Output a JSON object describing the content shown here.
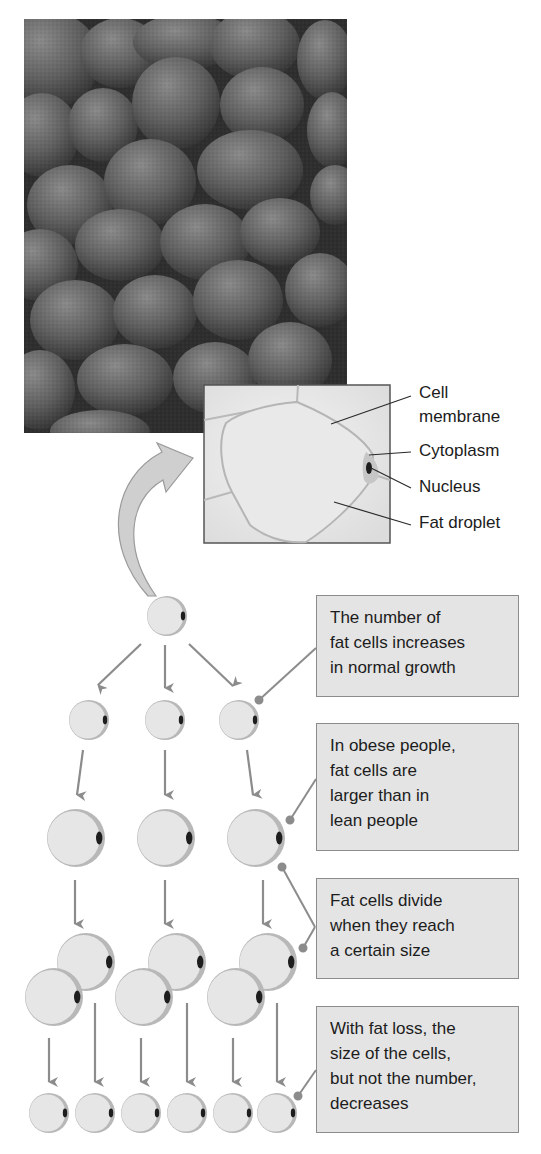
{
  "inset_labels": {
    "cell_membrane": [
      "Cell",
      "membrane"
    ],
    "cytoplasm": "Cytoplasm",
    "nucleus": "Nucleus",
    "fat_droplet": "Fat droplet"
  },
  "callouts": [
    {
      "lines": [
        "The number of",
        "fat cells increases",
        "in normal growth"
      ]
    },
    {
      "lines": [
        "In obese people,",
        "fat cells are",
        "larger than in",
        "lean people"
      ]
    },
    {
      "lines": [
        "Fat cells divide",
        "when they reach",
        "a certain size"
      ]
    },
    {
      "lines": [
        "With fat loss, the",
        "size of the cells,",
        "but not the number,",
        "decreases"
      ]
    }
  ],
  "colors": {
    "cell_fill": "#e6e6e6",
    "cell_rim": "#b4b4b4",
    "nucleus": "#1e1e1e",
    "arrow": "#8c8c8c",
    "box_fill": "#e4e4e4",
    "box_border": "#8c8c8c",
    "micrograph_bg": "#3a3a3a"
  }
}
